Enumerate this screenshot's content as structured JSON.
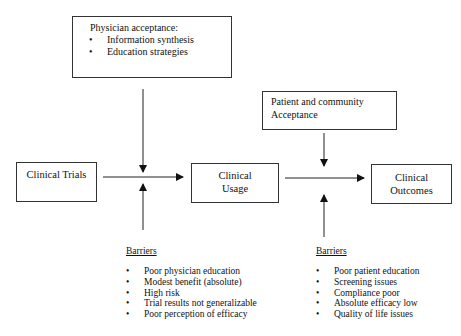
{
  "diagram": {
    "nodes": {
      "physician_acceptance": {
        "title": "Physician acceptance:",
        "items": [
          "Information synthesis",
          "Education strategies"
        ]
      },
      "patient_acceptance": {
        "line1": "Patient and community",
        "line2": "Acceptance"
      },
      "clinical_trials": {
        "label": "Clinical Trials"
      },
      "clinical_usage": {
        "line1": "Clinical",
        "line2": "Usage"
      },
      "clinical_outcomes": {
        "line1": "Clinical",
        "line2": "Outcomes"
      }
    },
    "barriers_left": {
      "title": "Barriers",
      "items": [
        "Poor physician education",
        "Modest benefit (absolute)",
        "High risk",
        "Trial results not generalizable",
        "Poor perception of efficacy"
      ]
    },
    "barriers_right": {
      "title": "Barriers",
      "items": [
        "Poor patient education",
        "Screening issues",
        "Compliance poor",
        "Absolute efficacy low",
        "Quality of life issues"
      ]
    },
    "edges": [
      {
        "from": "clinical_trials",
        "to": "clinical_usage"
      },
      {
        "from": "clinical_usage",
        "to": "clinical_outcomes"
      },
      {
        "from": "physician_acceptance",
        "to": "trials_usage_edge"
      },
      {
        "from": "barriers_left",
        "to": "trials_usage_edge"
      },
      {
        "from": "patient_acceptance",
        "to": "usage_outcomes_edge"
      },
      {
        "from": "barriers_right",
        "to": "usage_outcomes_edge"
      }
    ]
  }
}
